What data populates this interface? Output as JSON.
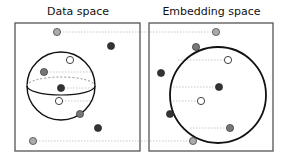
{
  "panels": {
    "left": {
      "title": "Data space"
    },
    "right": {
      "title": "Embedding space"
    }
  },
  "colors": {
    "frame": "#555555",
    "circle": "#111111",
    "connector": "#bbbbbb",
    "dark": "#333333",
    "mid": "#777777",
    "light": "#aaaaaa",
    "white": "#ffffff"
  },
  "diagram": {
    "frames": [
      {
        "id": "left",
        "x": 15,
        "y": 23,
        "w": 125,
        "h": 128
      },
      {
        "id": "right",
        "x": 149,
        "y": 23,
        "w": 124,
        "h": 128
      }
    ],
    "sphere": {
      "cx": 61,
      "cy": 86,
      "r": 34,
      "equator_ry": 9
    },
    "embedding_circle": {
      "cx": 218,
      "cy": 95,
      "r": 48
    },
    "points": [
      {
        "left": [
          57,
          32
        ],
        "right": [
          216,
          32
        ],
        "fill": "light"
      },
      {
        "left": [
          111,
          46
        ],
        "right": [
          161,
          73
        ],
        "fill": "dark"
      },
      {
        "left": [
          70,
          60
        ],
        "right": [
          228,
          60
        ],
        "fill": "white"
      },
      {
        "left": [
          44,
          72
        ],
        "right": [
          196,
          47
        ],
        "fill": "mid"
      },
      {
        "left": [
          61,
          88
        ],
        "right": [
          219,
          87
        ],
        "fill": "dark"
      },
      {
        "left": [
          59,
          101
        ],
        "right": [
          201,
          101
        ],
        "fill": "white"
      },
      {
        "left": [
          80,
          114
        ],
        "right": [
          230,
          128
        ],
        "fill": "mid"
      },
      {
        "left": [
          98,
          128
        ],
        "right": [
          170,
          114
        ],
        "fill": "dark"
      },
      {
        "left": [
          33,
          141
        ],
        "right": [
          193,
          141
        ],
        "fill": "light"
      }
    ],
    "connectors": [
      {
        "x1": 57,
        "y1": 32,
        "x2": 216,
        "y2": 32
      },
      {
        "x1": 33,
        "y1": 141,
        "x2": 193,
        "y2": 141
      },
      {
        "x1": 44,
        "y1": 72,
        "x2": 95,
        "y2": 72
      },
      {
        "x1": 61,
        "y1": 88,
        "x2": 95,
        "y2": 88
      },
      {
        "x1": 59,
        "y1": 101,
        "x2": 95,
        "y2": 101
      },
      {
        "x1": 178,
        "y1": 60,
        "x2": 228,
        "y2": 60
      },
      {
        "x1": 170,
        "y1": 87,
        "x2": 219,
        "y2": 87
      },
      {
        "x1": 170,
        "y1": 101,
        "x2": 201,
        "y2": 101
      },
      {
        "x1": 190,
        "y1": 128,
        "x2": 230,
        "y2": 128
      }
    ]
  }
}
